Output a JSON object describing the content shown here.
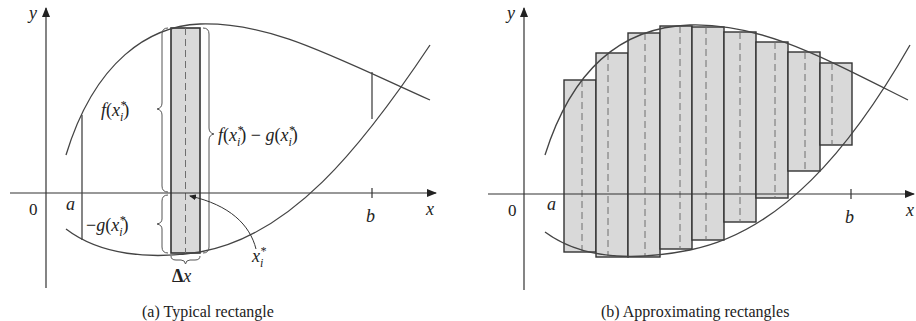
{
  "panels": [
    {
      "id": "a",
      "caption": "(a) Typical rectangle",
      "axis_labels": {
        "x": "x",
        "y": "y",
        "origin": "0",
        "a": "a",
        "b": "b"
      },
      "annotations": {
        "f_label": "f(x*i)",
        "neg_g_label": "−g(x*i)",
        "diff_label": "f(x*i) − g(x*i)",
        "sample_point": "x*i",
        "width": "Δx"
      }
    },
    {
      "id": "b",
      "caption": "(b) Approximating rectangles",
      "axis_labels": {
        "x": "x",
        "y": "y",
        "origin": "0",
        "a": "a",
        "b": "b"
      },
      "rectangle_count": 9
    }
  ],
  "colors": {
    "rect_fill": "#d9d9d9",
    "stroke": "#333333",
    "dash": "#6e6e6e",
    "background": "#ffffff"
  }
}
